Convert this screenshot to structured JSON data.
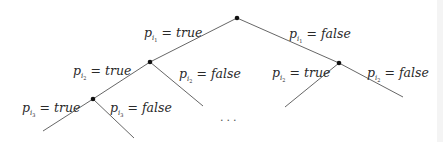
{
  "diagram": {
    "type": "decision-tree",
    "colors": {
      "edge": "#555555",
      "node": "#111111",
      "text": "#2a2a2a"
    },
    "nodes": [
      {
        "id": "root",
        "x": 237,
        "y": 18
      },
      {
        "id": "n_true",
        "x": 150,
        "y": 62
      },
      {
        "id": "n_false",
        "x": 339,
        "y": 63
      },
      {
        "id": "n_true_true",
        "x": 93,
        "y": 99
      }
    ],
    "edges": [
      {
        "from": "root",
        "x1": 237,
        "y1": 18,
        "x2": 150,
        "y2": 62,
        "label_index": 0
      },
      {
        "from": "root",
        "x1": 237,
        "y1": 18,
        "x2": 339,
        "y2": 63,
        "label_index": 1
      },
      {
        "from": "n_true",
        "x1": 150,
        "y1": 62,
        "x2": 93,
        "y2": 99,
        "label_index": 2
      },
      {
        "from": "n_true",
        "x1": 150,
        "y1": 62,
        "x2": 203,
        "y2": 106,
        "label_index": 3
      },
      {
        "from": "n_false",
        "x1": 339,
        "y1": 63,
        "x2": 285,
        "y2": 107,
        "label_index": 4
      },
      {
        "from": "n_false",
        "x1": 339,
        "y1": 63,
        "x2": 403,
        "y2": 97,
        "label_index": 5
      },
      {
        "from": "n_true_true",
        "x1": 93,
        "y1": 99,
        "x2": 43,
        "y2": 131,
        "label_index": 6
      },
      {
        "from": "n_true_true",
        "x1": 93,
        "y1": 99,
        "x2": 134,
        "y2": 138,
        "label_index": 7
      }
    ],
    "labels": [
      {
        "var": "p",
        "sub": "i",
        "subsub": "1",
        "eq": "=",
        "value": "true",
        "x": 144,
        "y": 37
      },
      {
        "var": "p",
        "sub": "i",
        "subsub": "1",
        "eq": "=",
        "value": "false",
        "x": 289,
        "y": 38
      },
      {
        "var": "p",
        "sub": "i",
        "subsub": "2",
        "eq": "=",
        "value": "true",
        "x": 73,
        "y": 75
      },
      {
        "var": "p",
        "sub": "i",
        "subsub": "2",
        "eq": "=",
        "value": "false",
        "x": 179,
        "y": 78
      },
      {
        "var": "p",
        "sub": "i",
        "subsub": "2",
        "eq": "=",
        "value": "true",
        "x": 272,
        "y": 77
      },
      {
        "var": "p",
        "sub": "i",
        "subsub": "2",
        "eq": "=",
        "value": "false",
        "x": 367,
        "y": 77
      },
      {
        "var": "p",
        "sub": "i",
        "subsub": "3",
        "eq": "=",
        "value": "true",
        "x": 22,
        "y": 112
      },
      {
        "var": "p",
        "sub": "i",
        "subsub": "3",
        "eq": "=",
        "value": "false",
        "x": 110,
        "y": 112
      }
    ],
    "ellipsis": {
      "text": "...",
      "x": 220,
      "y": 121
    }
  }
}
